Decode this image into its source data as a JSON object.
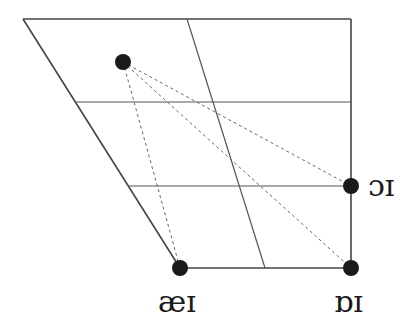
{
  "diagram": {
    "title": "",
    "colors": {
      "line": "#444444",
      "dashed": "#555555",
      "dot": "#1a1a1a"
    },
    "frame": {
      "top_left": [
        23,
        19
      ],
      "top_right": [
        351,
        19
      ],
      "bottom_left": [
        180,
        268
      ],
      "bottom_right": [
        351,
        268
      ]
    },
    "grid": {
      "vertical_mid": [
        [
          187,
          19
        ],
        [
          265,
          268
        ]
      ],
      "horizontal_1_y": 102,
      "horizontal_2_y": 186
    },
    "points": [
      {
        "id": "start",
        "label": "",
        "x": 123,
        "y": 62
      },
      {
        "id": "oi",
        "label": "ɔɪ",
        "x": 351,
        "y": 186
      },
      {
        "id": "aei",
        "label": "æɪ",
        "x": 180,
        "y": 268
      },
      {
        "id": "obi",
        "label": "ɒɪ",
        "x": 351,
        "y": 268
      }
    ],
    "labels": {
      "oi": "ɔɪ",
      "aei": "æɪ",
      "obi": "ɒɪ"
    }
  }
}
